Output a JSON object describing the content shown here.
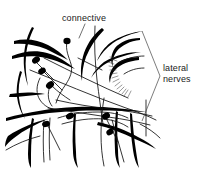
{
  "figure": {
    "kind": "anatomical-line-drawing",
    "background_color": "#ffffff",
    "ink_color": "#000000",
    "width": 200,
    "height": 170
  },
  "labels": {
    "connective": {
      "text": "connective",
      "x": 62,
      "y": 21,
      "leader_from_x": 85,
      "leader_from_y": 24,
      "leader_to_x": 79,
      "leader_to_y": 38
    },
    "lateral_nerves": {
      "line1": "lateral",
      "line2": "nerves",
      "x": 163,
      "y1": 71,
      "y2": 82
    }
  },
  "bracket": {
    "name": "lateral-nerves-bracket",
    "points": "142,31 160,76 142,121",
    "apex_x": 160,
    "apex_y": 76
  },
  "structures": {
    "trunks": [
      {
        "name": "upper-left-trunk-a",
        "d": "M14,41 C26,38 38,40 48,45 C56,49 62,54 68,60 C62,57 54,53 46,49 C36,45 25,43 14,44 Z"
      },
      {
        "name": "upper-left-trunk-b",
        "d": "M12,56 C24,51 36,50 47,53 C58,56 67,62 75,69 C66,65 56,60 46,58 C34,55 22,56 12,59 Z"
      },
      {
        "name": "upper-left-hook",
        "d": "M34,28 C30,36 27,45 26,56 C25,66 26,76 28,86 C25,77 23,66 24,55 C25,43 28,34 32,27 Z"
      },
      {
        "name": "left-lower-hook",
        "d": "M22,72 C19,80 18,89 19,98 C20,106 22,113 25,119 C21,113 18,105 17,97 C16,87 18,78 20,71 Z"
      },
      {
        "name": "center-upper-arc",
        "d": "M104,30 C96,38 90,47 86,57 C83,65 82,73 82,81 C80,72 81,62 84,53 C88,42 95,33 102,28 Z"
      },
      {
        "name": "right-upper-trunk",
        "d": "M110,43 C120,36 132,32 144,31 C133,33 122,37 113,43 C106,48 101,54 97,61 C100,53 105,47 110,43 Z"
      },
      {
        "name": "right-mid-trunk",
        "d": "M104,62 C116,55 128,52 141,52 C129,54 118,57 109,62 C101,66 95,72 91,78 C94,71 99,66 104,62 Z"
      },
      {
        "name": "right-loop-upper",
        "d": "M140,40 C130,41 122,45 117,51 C113,56 112,62 113,67 C110,61 111,54 115,48 C120,42 129,38 140,38 Z"
      },
      {
        "name": "right-loop-lower",
        "d": "M139,60 C129,61 121,64 116,69 C112,73 110,78 110,83 C108,77 110,71 114,66 C119,60 128,57 139,57 Z"
      },
      {
        "name": "main-horizontal-trunk",
        "d": "M6,118 C28,112 52,108 76,107 C100,106 124,108 146,112 C124,111 100,110 76,111 C52,112 28,115 6,121 Z"
      },
      {
        "name": "lower-left-branch",
        "d": "M34,119 C32,130 31,142 31,155 C31,161 31,165 31,168 C29,165 28,160 28,154 C28,141 30,129 32,118 Z"
      },
      {
        "name": "lower-center-branch",
        "d": "M76,114 C75,126 75,139 76,152 C76,159 77,164 78,168 C75,164 73,158 73,151 C72,138 73,125 74,113 Z"
      },
      {
        "name": "lower-right-branch",
        "d": "M118,112 C117,124 117,137 118,150 C118,158 119,164 120,168 C117,164 115,157 115,150 C114,136 115,123 116,111 Z"
      },
      {
        "name": "lower-right-branch-2",
        "d": "M132,114 C133,126 134,139 136,151 C137,158 138,164 139,168 C136,164 134,157 133,150 C131,137 130,124 130,113 Z"
      },
      {
        "name": "lower-left-sweep",
        "d": "M8,136 C20,128 34,122 48,119 C36,124 24,130 14,138 C10,141 7,144 5,147 C5,143 6,139 8,136 Z"
      },
      {
        "name": "right-lower-sweep",
        "d": "M98,122 C112,125 126,130 138,137 C146,141 152,145 156,149 C150,146 143,142 135,139 C123,133 110,128 97,125 Z"
      },
      {
        "name": "left-mid-short",
        "d": "M10,94 C22,92 34,92 45,94 C36,95 26,96 16,97 C13,97 11,97 9,97 Z"
      }
    ],
    "fibers": [
      {
        "name": "fiber-diag-long",
        "d": "M30,70 C60,82 92,96 126,108 C138,112 148,116 156,120"
      },
      {
        "name": "fiber-diag-2",
        "d": "M44,58 C72,72 100,86 128,98"
      },
      {
        "name": "fiber-center-wavy",
        "d": "M67,41 C65,50 69,57 71,64 C73,71 70,78 66,84 C62,90 58,96 56,103"
      },
      {
        "name": "fiber-vertical-center",
        "d": "M95,26 C94,44 95,62 97,80 C99,96 101,110 103,124"
      },
      {
        "name": "fiber-vertical-center-2",
        "d": "M104,98 C102,110 101,122 101,134 C101,146 102,156 104,166"
      },
      {
        "name": "fiber-left-curl",
        "d": "M40,78 C36,86 36,94 40,100 C44,106 50,109 56,110"
      },
      {
        "name": "fiber-left-curl-2",
        "d": "M50,86 C47,94 48,101 52,106"
      },
      {
        "name": "fiber-mid-cross",
        "d": "M56,100 C74,104 92,107 110,109 C126,111 140,113 152,116"
      },
      {
        "name": "fiber-mid-cross-2",
        "d": "M48,108 C68,111 88,114 108,117 C124,119 138,122 150,125"
      },
      {
        "name": "fiber-lower-arc",
        "d": "M58,118 C70,114 84,112 98,112 C110,112 120,114 128,118"
      },
      {
        "name": "fiber-lower-arc-2",
        "d": "M62,124 C76,120 90,118 104,119 C114,120 122,123 128,127"
      },
      {
        "name": "fiber-right-vert",
        "d": "M146,100 C146,112 146,124 146,136"
      },
      {
        "name": "fiber-left-vert",
        "d": "M50,118 C49,132 49,146 50,160"
      },
      {
        "name": "fiber-left-vert-2",
        "d": "M44,120 C43,134 43,148 44,162"
      },
      {
        "name": "fiber-right-down",
        "d": "M112,120 C116,134 120,148 124,162"
      },
      {
        "name": "fiber-top-right-edge",
        "d": "M120,62 C128,58 136,56 144,56"
      },
      {
        "name": "fiber-upper-join",
        "d": "M78,58 C86,62 94,66 102,70"
      },
      {
        "name": "fiber-soma-tail-1",
        "d": "M36,62 C42,68 48,74 54,80"
      },
      {
        "name": "fiber-soma-tail-2",
        "d": "M44,72 C50,78 56,84 62,90"
      },
      {
        "name": "fiber-soma-tail-3",
        "d": "M52,86 C58,92 64,96 70,100"
      },
      {
        "name": "fiber-soma-tail-4",
        "d": "M48,126 C52,134 56,142 60,150"
      },
      {
        "name": "fiber-soma-tail-5",
        "d": "M106,118 C110,126 114,134 118,142"
      },
      {
        "name": "fiber-right-inner",
        "d": "M124,74 C130,70 137,68 144,68"
      },
      {
        "name": "fiber-bottom-left",
        "d": "M6,150 C16,144 28,139 40,136"
      },
      {
        "name": "fiber-bottom-right",
        "d": "M140,124 C148,128 155,133 160,138"
      }
    ],
    "somata": [
      {
        "name": "soma-1",
        "cx": 36,
        "cy": 60,
        "rx": 4.2,
        "ry": 3.2,
        "rot": -35
      },
      {
        "name": "soma-2",
        "cx": 42,
        "cy": 71,
        "rx": 4.0,
        "ry": 3.0,
        "rot": -30
      },
      {
        "name": "soma-3",
        "cx": 50,
        "cy": 85,
        "rx": 4.4,
        "ry": 3.2,
        "rot": -40
      },
      {
        "name": "soma-4",
        "cx": 67,
        "cy": 41,
        "rx": 3.6,
        "ry": 3.2,
        "rot": 0
      },
      {
        "name": "soma-5",
        "cx": 46,
        "cy": 124,
        "rx": 4.0,
        "ry": 3.0,
        "rot": -20
      },
      {
        "name": "soma-6",
        "cx": 70,
        "cy": 116,
        "rx": 4.2,
        "ry": 3.0,
        "rot": -25
      },
      {
        "name": "soma-7",
        "cx": 106,
        "cy": 116,
        "rx": 4.2,
        "ry": 3.2,
        "rot": -30
      },
      {
        "name": "soma-8",
        "cx": 110,
        "cy": 132,
        "rx": 3.8,
        "ry": 3.0,
        "rot": -30
      }
    ],
    "fringe": {
      "name": "fringe-hatching",
      "lines": [
        "M114,64 L108,62",
        "M115,67 L109,66",
        "M116,70 L110,70",
        "M117,73 L111,74",
        "M118,76 L112,78",
        "M119,79 L113,82",
        "M120,82 L115,86",
        "M122,85 L117,89",
        "M124,87 L119,92",
        "M126,89 L122,94",
        "M128,90 L124,96",
        "M131,91 L128,97",
        "M116,58 L110,57",
        "M117,61 L111,59"
      ]
    }
  }
}
